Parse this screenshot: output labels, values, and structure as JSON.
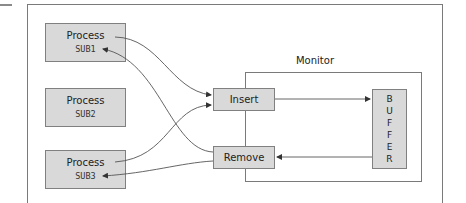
{
  "diagram": {
    "monitor_label": "Monitor",
    "processes": [
      {
        "label": "Process",
        "id": "SUB1"
      },
      {
        "label": "Process",
        "id": "SUB2"
      },
      {
        "label": "Process",
        "id": "SUB3"
      }
    ],
    "operations": {
      "insert": "Insert",
      "remove": "Remove"
    },
    "buffer_letters": [
      "B",
      "U",
      "F",
      "F",
      "E",
      "R"
    ],
    "colors": {
      "box_fill": "#d9d9d9",
      "box_border": "#808080",
      "line": "#555555"
    }
  }
}
